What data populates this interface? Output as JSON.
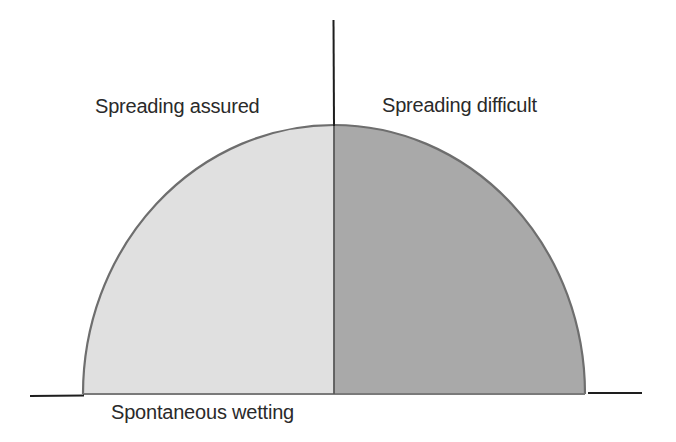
{
  "diagram": {
    "labels": {
      "left_region": "Spreading assured",
      "right_region": "Spreading difficult",
      "baseline": "Spontaneous wetting"
    },
    "regions": [
      {
        "name": "spreading-assured",
        "side": "left",
        "fill": "#e0e0e0"
      },
      {
        "name": "spreading-difficult",
        "side": "right",
        "fill": "#a9a9a9"
      }
    ],
    "colors": {
      "outline": "#6e6e6e",
      "axis": "#1e1e1e",
      "left_fill": "#e0e0e0",
      "right_fill": "#a9a9a9",
      "text": "#2a2a2a"
    },
    "geometry": {
      "dome_center_x": 334,
      "dome_base_y": 394,
      "dome_rx": 251,
      "dome_ry": 269,
      "vertical_axis_top_y": 20
    }
  }
}
